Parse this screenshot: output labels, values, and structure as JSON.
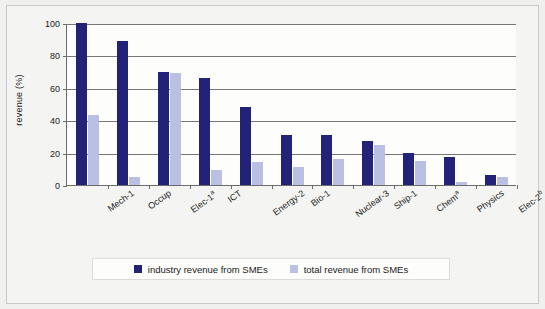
{
  "chart_data": {
    "type": "bar",
    "title": "",
    "xlabel": "",
    "ylabel": "revenue (%)",
    "ylim": [
      0,
      100
    ],
    "yticks": [
      0,
      20,
      40,
      60,
      80,
      100
    ],
    "ytick_labels": [
      "0",
      "20",
      "40",
      "60",
      "80",
      "100"
    ],
    "grid": true,
    "legend_position": "bottom",
    "categories": [
      "Mech-1",
      "Occup",
      "Elec-1*",
      "ICT",
      "Energy-2",
      "Bio-1",
      "Nuclear-3",
      "Ship-1",
      "Chem*",
      "Physics",
      "Elec-2b"
    ],
    "category_labels": [
      {
        "base": "Mech-1",
        "sup": ""
      },
      {
        "base": "Occup",
        "sup": ""
      },
      {
        "base": "Elec-1",
        "sup": "a"
      },
      {
        "base": "ICT",
        "sup": ""
      },
      {
        "base": "Energy-2",
        "sup": ""
      },
      {
        "base": "Bio-1",
        "sup": ""
      },
      {
        "base": "Nuclear-3",
        "sup": ""
      },
      {
        "base": "Ship-1",
        "sup": ""
      },
      {
        "base": "Chem",
        "sup": "a"
      },
      {
        "base": "Physics",
        "sup": ""
      },
      {
        "base": "Elec-2",
        "sup": "b"
      }
    ],
    "series": [
      {
        "name": "industry revenue from SMEs",
        "color": "#232279",
        "values": [
          100,
          89,
          70,
          66,
          48,
          31,
          31,
          27,
          20,
          17,
          6
        ]
      },
      {
        "name": "total revenue from SMEs",
        "color": "#b9c0e2",
        "values": [
          43,
          5,
          69,
          9,
          14,
          11,
          16,
          25,
          15,
          2,
          5
        ]
      }
    ]
  },
  "legend": {
    "entries": [
      {
        "label": "industry revenue from SMEs",
        "color": "#232279"
      },
      {
        "label": "total revenue from SMEs",
        "color": "#b9c0e2"
      }
    ]
  },
  "colors": {
    "series_dark": "#232279",
    "series_light": "#b9c0e2",
    "axis": "#6b6b6b",
    "gridline": "#767676",
    "plot_background": "#fdfdfc",
    "page_background": "#f4f4f2"
  }
}
